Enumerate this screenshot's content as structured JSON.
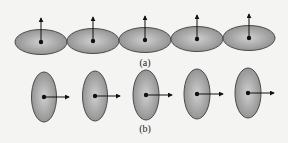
{
  "figure": {
    "width": 288,
    "height": 143,
    "colors": {
      "background": "#f4f4f2",
      "ellipse_fill_center": "#cfcfcf",
      "ellipse_fill_edge": "#8e8e8e",
      "ellipse_stroke": "#4a4a4a",
      "vector": "#111111"
    }
  },
  "panel_a": {
    "label": "(a)",
    "label_pos": {
      "x": 145,
      "y": 58
    },
    "orientation": "horizontal ellipses, vectors pointing up",
    "ellipses": [
      {
        "cx": 41,
        "cy": 42,
        "rx": 26,
        "ry": 12.5,
        "arrow_tip": {
          "x": 41,
          "y": 18
        }
      },
      {
        "cx": 93,
        "cy": 41,
        "rx": 26,
        "ry": 12.5,
        "arrow_tip": {
          "x": 93,
          "y": 17
        }
      },
      {
        "cx": 145,
        "cy": 40,
        "rx": 26,
        "ry": 12.5,
        "arrow_tip": {
          "x": 145,
          "y": 16
        }
      },
      {
        "cx": 197,
        "cy": 39,
        "rx": 26,
        "ry": 12.5,
        "arrow_tip": {
          "x": 197,
          "y": 15
        }
      },
      {
        "cx": 249,
        "cy": 38,
        "rx": 26,
        "ry": 12.5,
        "arrow_tip": {
          "x": 249,
          "y": 14
        }
      }
    ]
  },
  "panel_b": {
    "label": "(b)",
    "label_pos": {
      "x": 145,
      "y": 124
    },
    "orientation": "vertical ellipses, vectors pointing right",
    "ellipses": [
      {
        "cx": 44,
        "cy": 97,
        "rx": 12.5,
        "ry": 25,
        "arrow_tip": {
          "x": 69,
          "y": 97
        }
      },
      {
        "cx": 95,
        "cy": 96,
        "rx": 12.5,
        "ry": 25,
        "arrow_tip": {
          "x": 120,
          "y": 96
        }
      },
      {
        "cx": 146,
        "cy": 95,
        "rx": 13,
        "ry": 25,
        "arrow_tip": {
          "x": 172,
          "y": 95
        }
      },
      {
        "cx": 197,
        "cy": 94,
        "rx": 13,
        "ry": 25,
        "arrow_tip": {
          "x": 223,
          "y": 94
        }
      },
      {
        "cx": 248,
        "cy": 93,
        "rx": 13,
        "ry": 25,
        "arrow_tip": {
          "x": 274,
          "y": 93
        }
      }
    ]
  }
}
